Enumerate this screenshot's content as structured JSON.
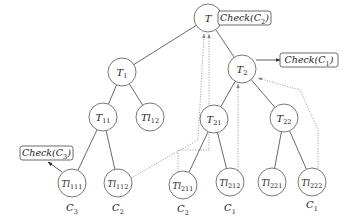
{
  "diagram": {
    "type": "tree",
    "colors": {
      "edge": "#444444",
      "dotted": "#9a9a9a",
      "node_stroke": "#555555",
      "text": "#222222"
    },
    "nodes": [
      {
        "id": "T",
        "base": "T",
        "sub": "",
        "cx": 208,
        "cy": 18,
        "r": 14
      },
      {
        "id": "T1",
        "base": "T",
        "sub": "1",
        "cx": 122,
        "cy": 72,
        "r": 14
      },
      {
        "id": "T2",
        "base": "T",
        "sub": "2",
        "cx": 242,
        "cy": 69,
        "r": 14
      },
      {
        "id": "T11",
        "base": "T",
        "sub": "11",
        "cx": 103,
        "cy": 117,
        "r": 14
      },
      {
        "id": "Tl12",
        "base": "Tl",
        "sub": "12",
        "cx": 150,
        "cy": 117,
        "r": 14
      },
      {
        "id": "T21",
        "base": "T",
        "sub": "21",
        "cx": 214,
        "cy": 119,
        "r": 14
      },
      {
        "id": "T22",
        "base": "T",
        "sub": "22",
        "cx": 284,
        "cy": 118,
        "r": 14
      },
      {
        "id": "Tl111",
        "base": "Tl",
        "sub": "111",
        "cx": 72,
        "cy": 183,
        "r": 14
      },
      {
        "id": "Tl112",
        "base": "Tl",
        "sub": "112",
        "cx": 118,
        "cy": 183,
        "r": 14
      },
      {
        "id": "Tl211",
        "base": "Tl",
        "sub": "211",
        "cx": 183,
        "cy": 185,
        "r": 14
      },
      {
        "id": "Tl212",
        "base": "Tl",
        "sub": "212",
        "cx": 230,
        "cy": 182,
        "r": 14
      },
      {
        "id": "Tl221",
        "base": "Tl",
        "sub": "221",
        "cx": 272,
        "cy": 182,
        "r": 14
      },
      {
        "id": "Tl222",
        "base": "Tl",
        "sub": "222",
        "cx": 312,
        "cy": 182,
        "r": 14
      }
    ],
    "edges": [
      [
        "T",
        "T1"
      ],
      [
        "T",
        "T2"
      ],
      [
        "T1",
        "T11"
      ],
      [
        "T1",
        "Tl12"
      ],
      [
        "T2",
        "T21"
      ],
      [
        "T2",
        "T22"
      ],
      [
        "T11",
        "Tl111"
      ],
      [
        "T11",
        "Tl112"
      ],
      [
        "T21",
        "Tl211"
      ],
      [
        "T21",
        "Tl212"
      ],
      [
        "T22",
        "Tl221"
      ],
      [
        "T22",
        "Tl222"
      ]
    ],
    "leaf_costs": [
      {
        "node": "Tl111",
        "base": "C",
        "sub": "3",
        "x": 72,
        "y": 211
      },
      {
        "node": "Tl112",
        "base": "C",
        "sub": "2",
        "x": 118,
        "y": 211
      },
      {
        "node": "Tl211",
        "base": "C",
        "sub": "2",
        "x": 183,
        "y": 212
      },
      {
        "node": "Tl212",
        "base": "C",
        "sub": "1",
        "x": 230,
        "y": 211
      },
      {
        "node": "Tl222",
        "base": "C",
        "sub": "1",
        "x": 312,
        "y": 208
      }
    ],
    "checks": [
      {
        "id": "check-c2",
        "text": "Check(C",
        "sub": "2",
        "close": ")",
        "x": 218,
        "y": 11,
        "w": 53,
        "h": 14,
        "from": [
          222,
          18
        ],
        "to": [
          218,
          18
        ]
      },
      {
        "id": "check-c1",
        "text": "Check(C",
        "sub": "1",
        "close": ")",
        "x": 280,
        "y": 53,
        "w": 58,
        "h": 14,
        "from": [
          256,
          60
        ],
        "to": [
          280,
          60
        ]
      },
      {
        "id": "check-c3",
        "text": "Check(C",
        "sub": "3",
        "close": ")",
        "x": 20,
        "y": 146,
        "w": 53,
        "h": 14,
        "from": [
          62,
          172
        ],
        "to": [
          48,
          162
        ]
      }
    ],
    "dotted_paths": [
      {
        "from": "Tl112",
        "points": [
          [
            131,
            178
          ],
          [
            198,
            140
          ],
          [
            204,
            34
          ]
        ]
      },
      {
        "from": "Tl211",
        "points": [
          [
            178,
            172
          ],
          [
            178,
            150
          ],
          [
            209,
            150
          ],
          [
            209,
            34
          ]
        ]
      },
      {
        "from": "Tl212",
        "points": [
          [
            238,
            170
          ],
          [
            238,
            84
          ]
        ]
      },
      {
        "from": "Tl222",
        "points": [
          [
            318,
            170
          ],
          [
            318,
            130
          ],
          [
            300,
            90
          ],
          [
            258,
            78
          ]
        ]
      }
    ]
  }
}
